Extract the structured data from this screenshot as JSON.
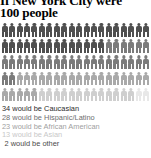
{
  "title": {
    "line1": "If New York City were",
    "line2": "100 people"
  },
  "chart_data": {
    "type": "pictogram",
    "title": "If New York City were 100 people",
    "unit_label": "person",
    "total": 100,
    "columns_per_row": 20,
    "rows": 5,
    "xlabel": "",
    "ylabel": "",
    "grid": false,
    "legend_position": "below",
    "categories": [
      "Caucasian",
      "Hispanic/Latino",
      "African American",
      "Asian",
      "other"
    ],
    "values": [
      34,
      28,
      23,
      13,
      2
    ],
    "colors": [
      "#4f4f4f",
      "#7b7b7b",
      "#a9a9a9",
      "#cfcfcf",
      "#e8e8e8"
    ],
    "legend_entries": [
      {
        "label": "34 would be Caucasian",
        "color": "#2b2b2b"
      },
      {
        "label": "28 would be Hispanic/Latino",
        "color": "#6e6e6e"
      },
      {
        "label": "23 would be African American",
        "color": "#a0a0a0"
      },
      {
        "label": "13 would be Asian",
        "color": "#c8c8c8"
      },
      {
        "label": "2 would be other",
        "color": "#4a4a4a"
      }
    ]
  }
}
